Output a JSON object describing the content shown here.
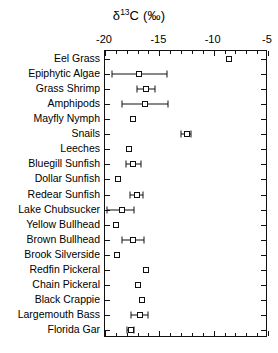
{
  "chart_data": {
    "type": "scatter",
    "orientation": "horizontal",
    "title_parts": {
      "delta": "δ",
      "superscript": "13",
      "element": "C",
      "units": "(‰)"
    },
    "xlabel": "δ13C (‰)",
    "ylabel": "",
    "xlim": [
      -20,
      -5
    ],
    "xticks": [
      -20,
      -15,
      -10,
      -5
    ],
    "xtick_labels": [
      "-20",
      "-15",
      "-10",
      "-5"
    ],
    "xminor_step": 1,
    "grid": false,
    "legend": false,
    "marker_style": "open-square",
    "categories": [
      "Eel Grass",
      "Epiphytic Algae",
      "Grass Shrimp",
      "Amphipods",
      "Mayfly Nymph",
      "Snails",
      "Leeches",
      "Bluegill Sunfish",
      "Dollar Sunfish",
      "Redear Sunfish",
      "Lake Chubsucker",
      "Yellow Bullhead",
      "Brown Bullhead",
      "Brook Silverside",
      "Redfin Pickeral",
      "Chain Pickeral",
      "Black Crappie",
      "Largemouth Bass",
      "Florida Gar"
    ],
    "values": [
      -8.6,
      -16.9,
      -16.2,
      -16.3,
      -17.4,
      -12.5,
      -17.8,
      -17.4,
      -18.8,
      -17.1,
      -18.4,
      -19.0,
      -17.4,
      -18.9,
      -16.2,
      -17.0,
      -16.6,
      -16.8,
      -17.6
    ],
    "err_low": [
      -8.6,
      -19.4,
      -17.1,
      -18.4,
      -17.4,
      -13.0,
      -17.8,
      -18.1,
      -18.8,
      -17.7,
      -19.8,
      -19.0,
      -18.4,
      -18.9,
      -16.2,
      -17.0,
      -16.6,
      -17.6,
      -18.0
    ],
    "err_high": [
      -8.6,
      -14.3,
      -15.4,
      -14.2,
      -17.4,
      -12.1,
      -17.8,
      -16.7,
      -18.8,
      -16.5,
      -17.3,
      -19.0,
      -16.4,
      -18.9,
      -16.2,
      -17.0,
      -16.6,
      -16.0,
      -17.3
    ],
    "has_error_bars": [
      false,
      true,
      true,
      true,
      false,
      true,
      false,
      true,
      false,
      true,
      true,
      false,
      true,
      false,
      false,
      false,
      false,
      true,
      true
    ]
  },
  "colors": {
    "axis": "#111111",
    "marker_edge": "#111111",
    "marker_fill": "#ffffff",
    "background": "#ffffff"
  }
}
